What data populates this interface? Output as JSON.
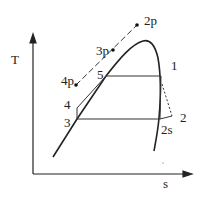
{
  "diagram": {
    "type": "T-s diagram",
    "axes": {
      "y_label": "T",
      "x_label": "s"
    },
    "state_points": [
      "1",
      "2",
      "2s",
      "3",
      "4",
      "5",
      "2p",
      "3p",
      "4p"
    ],
    "labels": {
      "T": "T",
      "s": "s",
      "p1": "1",
      "p2": "2",
      "p2s": "2s",
      "p3": "3",
      "p4": "4",
      "p5": "5",
      "p2p": "2p",
      "p3p": "3p",
      "p4p": "4p"
    }
  }
}
